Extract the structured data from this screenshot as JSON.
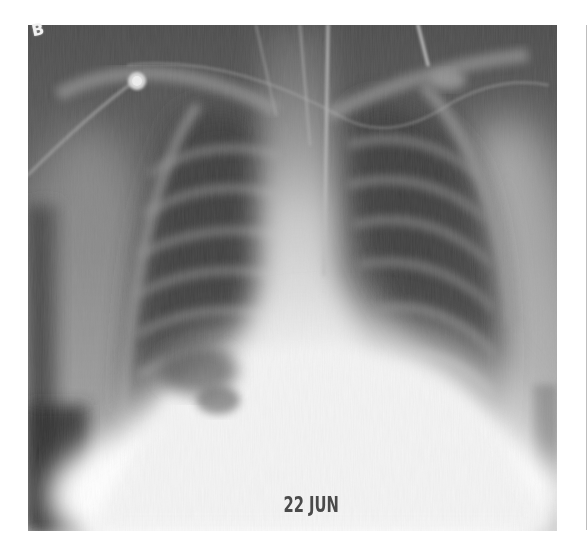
{
  "figure": {
    "panel_label": "B",
    "date_annotation": "22 JUN",
    "image_subject": "chest-radiograph-frontal"
  },
  "colors": {
    "background": "#ffffff",
    "lung_field_dark": "#4b4b4b",
    "soft_tissue_mid": "#8a8a8a",
    "heart_diaphragm_bright": "#f4f4f4",
    "date_text": "#4a4a4a",
    "side_rule": "#bdbdbd"
  }
}
